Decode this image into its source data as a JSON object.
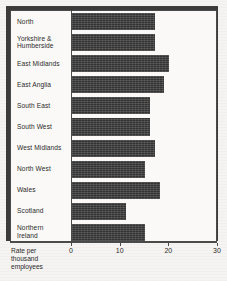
{
  "chart_data": {
    "type": "bar",
    "orientation": "horizontal",
    "title": "",
    "xlabel": "Rate per thousand employees",
    "ylabel": "",
    "xlim": [
      0,
      30
    ],
    "xticks": [
      0,
      10,
      20,
      30
    ],
    "grid": false,
    "legend": null,
    "categories": [
      "North",
      "Yorkshire &\nHumberside",
      "East Midlands",
      "East Anglia",
      "South East",
      "South West",
      "West Midlands",
      "North West",
      "Wales",
      "Scotland",
      "Northern\nIreland"
    ],
    "values": [
      17,
      17,
      20,
      19,
      16,
      16,
      17,
      15,
      18,
      11,
      15
    ]
  },
  "axis": {
    "title": "Rate per\nthousand\nemployees",
    "tick_labels": [
      "0",
      "10",
      "20",
      "30"
    ]
  },
  "colors": {
    "bar": "#3d3d3d",
    "frame": "#4a4a4a",
    "shadow": "#3b3b3b",
    "plot_background": "#faf9f7",
    "page_background": "#f5f4f2",
    "text": "#2a2a2a"
  }
}
